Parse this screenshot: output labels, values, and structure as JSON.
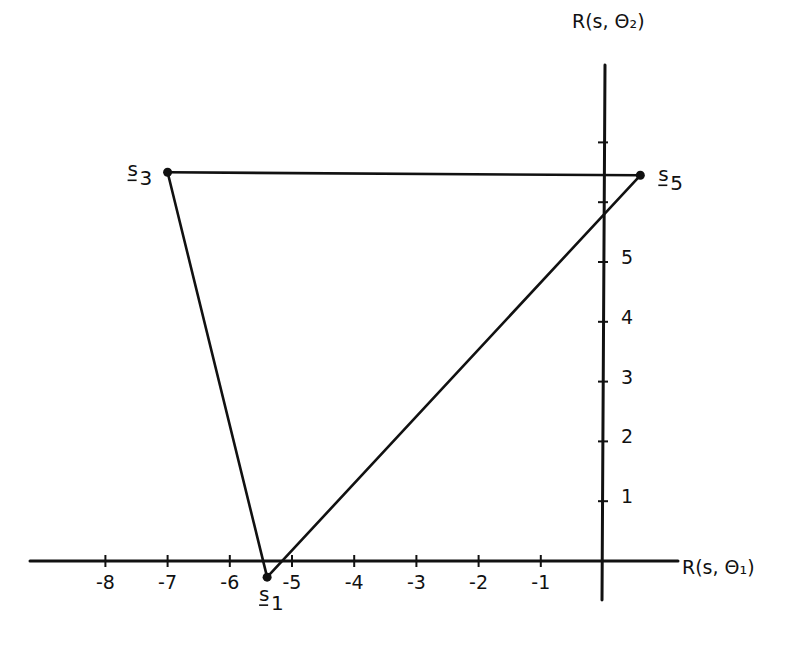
{
  "figure": {
    "x_axis_label": "R(s, Θ₁)",
    "y_axis_label": "R(s, Θ₂)",
    "x_ticks": [
      {
        "value": -8,
        "label": "-8"
      },
      {
        "value": -7,
        "label": "-7"
      },
      {
        "value": -6,
        "label": "-6"
      },
      {
        "value": -5,
        "label": "-5"
      },
      {
        "value": -4,
        "label": "-4"
      },
      {
        "value": -3,
        "label": "-3"
      },
      {
        "value": -2,
        "label": "-2"
      },
      {
        "value": -1,
        "label": "-1"
      }
    ],
    "y_ticks": [
      {
        "value": 1,
        "label": "1"
      },
      {
        "value": 2,
        "label": "2"
      },
      {
        "value": 3,
        "label": "3"
      },
      {
        "value": 4,
        "label": "4"
      },
      {
        "value": 5,
        "label": "5"
      },
      {
        "value": 6,
        "label": ""
      },
      {
        "value": 7,
        "label": ""
      }
    ],
    "vertices": [
      {
        "id": "s1",
        "label_base": "s",
        "label_sub": "1",
        "x": -5.4,
        "y": -0.27
      },
      {
        "id": "s3",
        "label_base": "s",
        "label_sub": "3",
        "x": -7.0,
        "y": 6.5
      },
      {
        "id": "s5",
        "label_base": "s",
        "label_sub": "5",
        "x": 0.6,
        "y": 6.45
      }
    ],
    "edges": [
      [
        "s1",
        "s3"
      ],
      [
        "s3",
        "s5"
      ],
      [
        "s5",
        "s1"
      ]
    ]
  },
  "chart_data": {
    "type": "scatter",
    "title": "",
    "xlabel": "R(s, Θ₁)",
    "ylabel": "R(s, Θ₂)",
    "xlim": [
      -9,
      1.2
    ],
    "ylim": [
      -0.6,
      8.2
    ],
    "grid": false,
    "points": [
      {
        "label": "s1",
        "x": -5.4,
        "y": -0.27
      },
      {
        "label": "s3",
        "x": -7.0,
        "y": 6.5
      },
      {
        "label": "s5",
        "x": 0.6,
        "y": 6.45
      }
    ],
    "polygon": [
      "s1",
      "s3",
      "s5"
    ]
  }
}
